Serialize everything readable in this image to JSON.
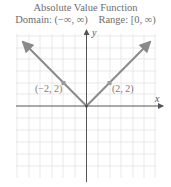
{
  "title": "Absolute Value Function",
  "domain_label": "Domain: (−∞, ∞)",
  "range_label": "Range: [0, ∞)",
  "axes": {
    "x_label": "x",
    "y_label": "y"
  },
  "points": [
    {
      "label": "(−2, 2)",
      "x": -2,
      "y": 2
    },
    {
      "label": "(2, 2)",
      "x": 2,
      "y": 2
    }
  ],
  "function": "y = |x|",
  "colors": {
    "graph": "#8a8a8a",
    "grid": "#e2e2e2",
    "axis": "#6a6a6a",
    "point": "#8a8a8a"
  }
}
